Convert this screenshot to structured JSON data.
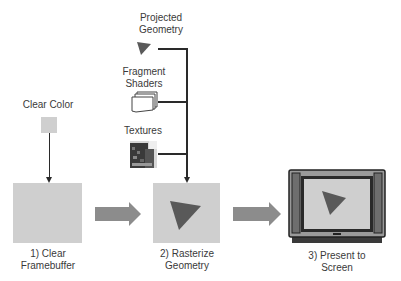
{
  "inputs": {
    "projected_geometry": {
      "label_line1": "Projected",
      "label_line2": "Geometry"
    },
    "fragment_shaders": {
      "label_line1": "Fragment",
      "label_line2": "Shaders"
    },
    "textures": {
      "label": "Textures"
    },
    "clear_color": {
      "label": "Clear Color"
    }
  },
  "steps": [
    {
      "label_line1": "1) Clear",
      "label_line2": "Framebuffer"
    },
    {
      "label_line1": "2) Rasterize",
      "label_line2": "Geometry"
    },
    {
      "label_line1": "3) Present to",
      "label_line2": "Screen"
    }
  ],
  "colors": {
    "box_fill": "#cfcfcf",
    "triangle": "#595959",
    "arrow": "#8c8c8c",
    "line": "#2a2a2a"
  }
}
